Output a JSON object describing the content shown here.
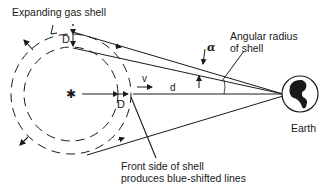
{
  "diagram": {
    "labels": {
      "shell": "Expanding gas shell",
      "angular_radius_line1": "Angular radius",
      "angular_radius_line2": "of shell",
      "front_side_line1": "Front side of shell",
      "front_side_line2": "produces blue-shifted lines",
      "earth": "Earth",
      "thickness_top": "D",
      "thickness_front": "D",
      "velocity": "v",
      "distance": "d",
      "angle": "α",
      "star_symbol": "✱"
    },
    "colors": {
      "ink": "#1a1a1a",
      "background": "#ffffff"
    }
  }
}
